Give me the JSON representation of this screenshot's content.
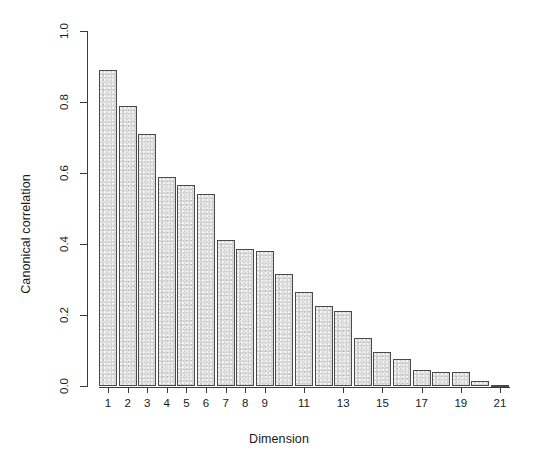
{
  "chart_data": {
    "type": "bar",
    "title": "",
    "subtitle": "",
    "xlabel": "Dimension",
    "ylabel": "Canonical correlation",
    "categories": [
      1,
      2,
      3,
      4,
      5,
      6,
      7,
      8,
      9,
      10,
      11,
      12,
      13,
      14,
      15,
      16,
      17,
      18,
      19,
      20,
      21
    ],
    "values": [
      0.89,
      0.79,
      0.71,
      0.59,
      0.565,
      0.54,
      0.41,
      0.385,
      0.38,
      0.315,
      0.265,
      0.225,
      0.21,
      0.135,
      0.095,
      0.075,
      0.045,
      0.04,
      0.04,
      0.015,
      0.003
    ],
    "ylim": [
      0.0,
      1.0
    ],
    "xlim": [
      0.5,
      21.5
    ],
    "yticks": [
      0.0,
      0.2,
      0.4,
      0.6,
      0.8,
      1.0
    ],
    "ytick_labels": [
      "0.0",
      "0.2",
      "0.4",
      "0.6",
      "0.8",
      "1.0"
    ],
    "xticks": [
      1,
      2,
      3,
      4,
      5,
      6,
      7,
      8,
      9,
      11,
      13,
      15,
      17,
      19,
      21
    ],
    "xtick_labels": [
      "1",
      "2",
      "3",
      "4",
      "5",
      "6",
      "7",
      "8",
      "9",
      "11",
      "13",
      "15",
      "17",
      "19",
      "21"
    ],
    "grid": false,
    "legend": null,
    "bar_fill_color": "#d3d3d3",
    "bar_border_color": "#4a4a4a",
    "axis_color": "#3a3a3a",
    "background_color": "#ffffff"
  }
}
